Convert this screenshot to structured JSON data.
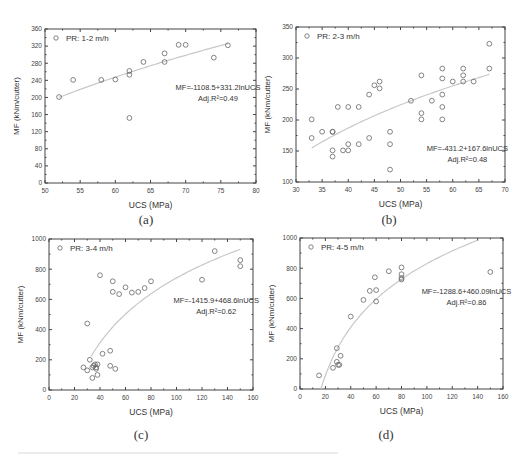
{
  "figure": {
    "sublabels": [
      "(a)",
      "(b)",
      "(c)",
      "(d)"
    ]
  },
  "chart_data": [
    {
      "type": "scatter",
      "panel": "(a)",
      "legend": "PR: 1-2 m/h",
      "xlabel": "UCS (MPa)",
      "ylabel": "MF (kNm/cutter)",
      "xlim": [
        50,
        80
      ],
      "ylim": [
        0,
        360
      ],
      "xticks": [
        50,
        55,
        60,
        65,
        70,
        75,
        80
      ],
      "yticks": [
        0,
        40,
        80,
        120,
        160,
        200,
        240,
        280,
        320,
        360
      ],
      "equation": "MF=-1108.5+331.2lnUCS",
      "r2": "Adj.R²=0.49",
      "fit": {
        "a": -1108.5,
        "b": 331.2,
        "x_from": 52,
        "x_to": 76
      },
      "points": [
        [
          52,
          201
        ],
        [
          54,
          241
        ],
        [
          58,
          241
        ],
        [
          60,
          242
        ],
        [
          62,
          152
        ],
        [
          62,
          253
        ],
        [
          62,
          262
        ],
        [
          64,
          283
        ],
        [
          67,
          283
        ],
        [
          67,
          303
        ],
        [
          69,
          323
        ],
        [
          70,
          323
        ],
        [
          74,
          293
        ],
        [
          76,
          322
        ]
      ]
    },
    {
      "type": "scatter",
      "panel": "(b)",
      "legend": "PR: 2-3 m/h",
      "xlabel": "UCS (MPa)",
      "ylabel": "MF (kNm/cutter)",
      "xlim": [
        30,
        70
      ],
      "ylim": [
        100,
        350
      ],
      "xticks": [
        30,
        35,
        40,
        45,
        50,
        55,
        60,
        65,
        70
      ],
      "yticks": [
        100,
        150,
        200,
        250,
        300,
        350
      ],
      "equation": "MF=-431.2+167.6lnUCS",
      "r2": "Adj.R²=0.48",
      "fit": {
        "a": -431.2,
        "b": 167.6,
        "x_from": 33,
        "x_to": 67
      },
      "points": [
        [
          33,
          171
        ],
        [
          33,
          201
        ],
        [
          35,
          181
        ],
        [
          37,
          181
        ],
        [
          37,
          181
        ],
        [
          37,
          151
        ],
        [
          37,
          141
        ],
        [
          38,
          221
        ],
        [
          39,
          151
        ],
        [
          40,
          151
        ],
        [
          40,
          161
        ],
        [
          40,
          221
        ],
        [
          42,
          161
        ],
        [
          42,
          221
        ],
        [
          44,
          241
        ],
        [
          44,
          171
        ],
        [
          45,
          256
        ],
        [
          46,
          251
        ],
        [
          46,
          262
        ],
        [
          48,
          181
        ],
        [
          48,
          161
        ],
        [
          48,
          120
        ],
        [
          52,
          231
        ],
        [
          54,
          272
        ],
        [
          54,
          211
        ],
        [
          54,
          201
        ],
        [
          56,
          231
        ],
        [
          58,
          283
        ],
        [
          58,
          267
        ],
        [
          58,
          241
        ],
        [
          58,
          221
        ],
        [
          58,
          201
        ],
        [
          60,
          262
        ],
        [
          62,
          283
        ],
        [
          62,
          272
        ],
        [
          62,
          262
        ],
        [
          64,
          262
        ],
        [
          67,
          323
        ],
        [
          67,
          283
        ]
      ]
    },
    {
      "type": "scatter",
      "panel": "(c)",
      "legend": "PR: 3-4 m/h",
      "xlabel": "UCS (MPa)",
      "ylabel": "MF (kNm/cutter)",
      "xlim": [
        0,
        160
      ],
      "ylim": [
        0,
        1000
      ],
      "xticks": [
        0,
        20,
        40,
        60,
        80,
        100,
        120,
        140,
        160
      ],
      "yticks": [
        0,
        200,
        400,
        600,
        800,
        1000
      ],
      "equation": "MF=-1415.9+468.6lnUCS",
      "r2": "Adj.R²=0.62",
      "fit": {
        "a": -1415.9,
        "b": 468.6,
        "x_from": 33,
        "x_to": 150
      },
      "points": [
        [
          27,
          150
        ],
        [
          30,
          130
        ],
        [
          30,
          440
        ],
        [
          32,
          200
        ],
        [
          34,
          80
        ],
        [
          34,
          150
        ],
        [
          35,
          160
        ],
        [
          36,
          170
        ],
        [
          37,
          150
        ],
        [
          37,
          140
        ],
        [
          38,
          170
        ],
        [
          38,
          100
        ],
        [
          40,
          760
        ],
        [
          42,
          240
        ],
        [
          48,
          260
        ],
        [
          48,
          160
        ],
        [
          50,
          650
        ],
        [
          50,
          720
        ],
        [
          52,
          140
        ],
        [
          55,
          635
        ],
        [
          60,
          680
        ],
        [
          65,
          645
        ],
        [
          70,
          650
        ],
        [
          75,
          675
        ],
        [
          80,
          720
        ],
        [
          120,
          730
        ],
        [
          130,
          920
        ],
        [
          150,
          860
        ],
        [
          150,
          820
        ]
      ]
    },
    {
      "type": "scatter",
      "panel": "(d)",
      "legend": "PR: 4-5 m/h",
      "xlabel": "UCS (MPa)",
      "ylabel": "MF (kNm/cutter)",
      "xlim": [
        0,
        160
      ],
      "ylim": [
        0,
        1000
      ],
      "xticks": [
        0,
        20,
        40,
        60,
        80,
        100,
        120,
        140,
        160
      ],
      "yticks": [
        0,
        200,
        400,
        600,
        800,
        1000
      ],
      "equation": "MF=-1288.6+460.09lnUCS",
      "r2": "Adj.R²=0.86",
      "fit": {
        "a": -1288.6,
        "b": 460.09,
        "x_from": 16.5,
        "x_to": 140
      },
      "points": [
        [
          15,
          90
        ],
        [
          26,
          140
        ],
        [
          29,
          270
        ],
        [
          29,
          180
        ],
        [
          30,
          160
        ],
        [
          31,
          160
        ],
        [
          32,
          220
        ],
        [
          40,
          480
        ],
        [
          50,
          590
        ],
        [
          55,
          650
        ],
        [
          59,
          740
        ],
        [
          60,
          655
        ],
        [
          60,
          580
        ],
        [
          70,
          780
        ],
        [
          80,
          805
        ],
        [
          80,
          760
        ],
        [
          80,
          725
        ],
        [
          80,
          735
        ],
        [
          150,
          775
        ]
      ]
    }
  ]
}
